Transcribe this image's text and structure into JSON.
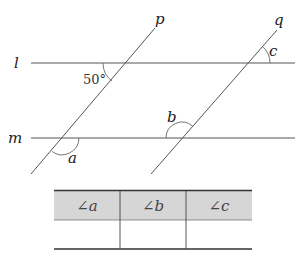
{
  "diagram": {
    "labels": {
      "line_l": "l",
      "line_m": "m",
      "line_p": "p",
      "line_q": "q",
      "angle_given": "50°",
      "angle_a": "a",
      "angle_b": "b",
      "angle_c": "c"
    },
    "colors": {
      "line": "#555555",
      "table_header": "#d6d6d6"
    }
  },
  "table": {
    "headers": [
      "∠a",
      "∠b",
      "∠c"
    ],
    "values": [
      "",
      "",
      ""
    ]
  }
}
